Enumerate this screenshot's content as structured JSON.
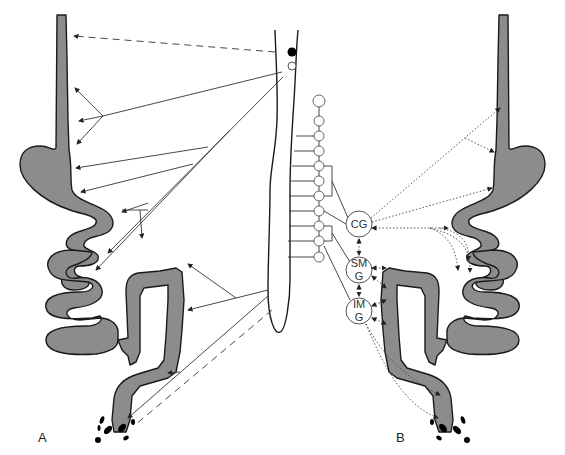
{
  "figure": {
    "panels": [
      {
        "id": "A",
        "label": "A"
      },
      {
        "id": "B",
        "label": "B"
      }
    ],
    "ganglia": [
      {
        "id": "cg",
        "line1": "CG",
        "line2": ""
      },
      {
        "id": "smg",
        "line1": "SM",
        "line2": "G"
      },
      {
        "id": "img",
        "line1": "IM",
        "line2": "G"
      }
    ],
    "colors": {
      "gut_fill": "#8c8c8c",
      "outline": "#1a1a1a",
      "background": "#ffffff"
    }
  }
}
